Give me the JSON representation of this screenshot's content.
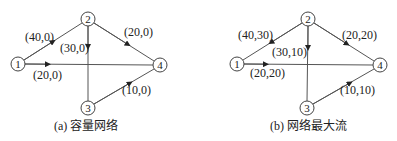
{
  "colors": {
    "stroke": "#555555",
    "text": "#222222",
    "background": "#ffffff"
  },
  "diagrams": [
    {
      "id": "a",
      "caption": "(a) 容量网络",
      "nodes": [
        {
          "id": "1",
          "label": "1",
          "x": 18,
          "y": 64
        },
        {
          "id": "2",
          "label": "2",
          "x": 88,
          "y": 19
        },
        {
          "id": "3",
          "label": "3",
          "x": 88,
          "y": 108
        },
        {
          "id": "4",
          "label": "4",
          "x": 160,
          "y": 65
        }
      ],
      "edges": [
        {
          "from": "1",
          "to": "2",
          "label": "(40,0)"
        },
        {
          "from": "1",
          "to": "4",
          "label": "(20,0)"
        },
        {
          "from": "2",
          "to": "3",
          "label": "(30,0)"
        },
        {
          "from": "2",
          "to": "4",
          "label": "(20,0)"
        },
        {
          "from": "3",
          "to": "4",
          "label": "(10,0)"
        }
      ]
    },
    {
      "id": "b",
      "caption": "(b) 网络最大流",
      "nodes": [
        {
          "id": "1",
          "label": "1",
          "x": 237,
          "y": 64
        },
        {
          "id": "2",
          "label": "2",
          "x": 308,
          "y": 19
        },
        {
          "id": "3",
          "label": "3",
          "x": 307,
          "y": 108
        },
        {
          "id": "4",
          "label": "4",
          "x": 380,
          "y": 65
        }
      ],
      "edges": [
        {
          "from": "1",
          "to": "2",
          "label": "(40,30)"
        },
        {
          "from": "1",
          "to": "4",
          "label": "(20,20)"
        },
        {
          "from": "2",
          "to": "3",
          "label": "(30,10)"
        },
        {
          "from": "2",
          "to": "4",
          "label": "(20,20)"
        },
        {
          "from": "3",
          "to": "4",
          "label": "(10,10)"
        }
      ]
    }
  ]
}
